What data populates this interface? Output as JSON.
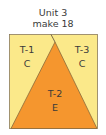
{
  "unit": {
    "title": "Unit 3",
    "instruction": "make 18"
  },
  "colors": {
    "light": "#FBE98A",
    "dark": "#F5962E",
    "stroke": "#8a7a5a",
    "text": "#3a3a3a"
  },
  "pieces": [
    {
      "id": "T-1",
      "fabric": "C"
    },
    {
      "id": "T-2",
      "fabric": "E"
    },
    {
      "id": "T-3",
      "fabric": "C"
    }
  ]
}
